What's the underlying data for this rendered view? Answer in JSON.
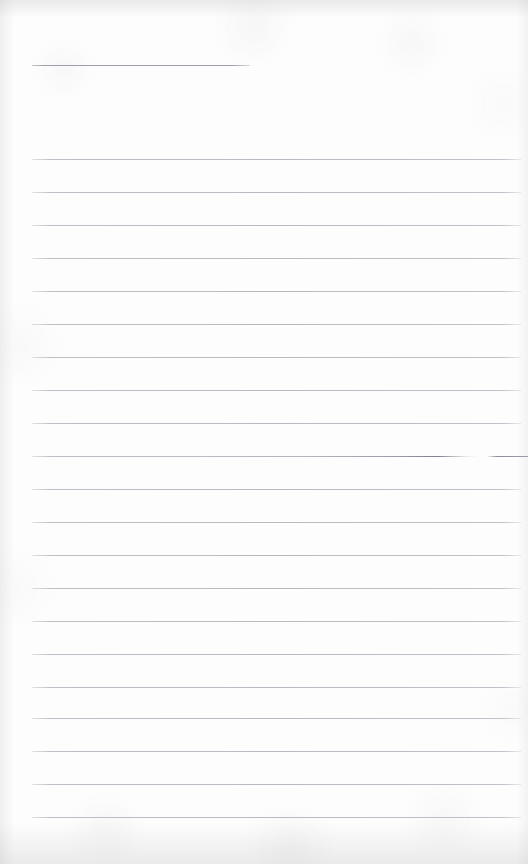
{
  "document": {
    "kind": "scanned-ruled-paper",
    "title": "Blank lined notebook page",
    "width": 528,
    "height": 864,
    "background_color": "#fdfdfd",
    "page_content_text": "",
    "handwriting_present": "none",
    "printed_text_present": "none"
  },
  "colors": {
    "paper": "#fdfdfd",
    "rule_light": "#bcbfc5",
    "rule_medium": "#b6b9c0",
    "rule_dark": "#9ca0a8",
    "rule_emphasis": "#7e828b",
    "edge_shadow": "#8c8c94"
  },
  "layout": {
    "rule_left_x": 32,
    "rule_right_x": 521,
    "rule_spacing": 33,
    "first_body_rule_y": 159,
    "last_body_rule_y": 816,
    "body_rule_count": 21
  },
  "header_rule": {
    "label": "short-top-rule",
    "x": 32,
    "y": 65,
    "width": 218
  },
  "body_rules": [
    {
      "y": 159,
      "x": 32,
      "width": 489,
      "emphasis": "normal"
    },
    {
      "y": 192,
      "x": 32,
      "width": 489,
      "emphasis": "normal"
    },
    {
      "y": 225,
      "x": 32,
      "width": 489,
      "emphasis": "normal"
    },
    {
      "y": 258,
      "x": 32,
      "width": 489,
      "emphasis": "normal"
    },
    {
      "y": 291,
      "x": 32,
      "width": 489,
      "emphasis": "normal"
    },
    {
      "y": 324,
      "x": 32,
      "width": 489,
      "emphasis": "normal"
    },
    {
      "y": 357,
      "x": 32,
      "width": 489,
      "emphasis": "normal"
    },
    {
      "y": 390,
      "x": 32,
      "width": 489,
      "emphasis": "normal"
    },
    {
      "y": 423,
      "x": 32,
      "width": 489,
      "emphasis": "normal"
    },
    {
      "y": 456,
      "x": 32,
      "width": 489,
      "emphasis": "strong"
    },
    {
      "y": 489,
      "x": 32,
      "width": 489,
      "emphasis": "normal"
    },
    {
      "y": 522,
      "x": 32,
      "width": 489,
      "emphasis": "normal"
    },
    {
      "y": 555,
      "x": 32,
      "width": 489,
      "emphasis": "normal"
    },
    {
      "y": 588,
      "x": 32,
      "width": 489,
      "emphasis": "normal"
    },
    {
      "y": 621,
      "x": 32,
      "width": 489,
      "emphasis": "normal"
    },
    {
      "y": 654,
      "x": 32,
      "width": 489,
      "emphasis": "normal"
    },
    {
      "y": 687,
      "x": 32,
      "width": 489,
      "emphasis": "normal"
    },
    {
      "y": 718,
      "x": 32,
      "width": 489,
      "emphasis": "normal"
    },
    {
      "y": 751,
      "x": 32,
      "width": 489,
      "emphasis": "normal"
    },
    {
      "y": 784,
      "x": 32,
      "width": 489,
      "emphasis": "normal"
    },
    {
      "y": 817,
      "x": 32,
      "width": 489,
      "emphasis": "normal"
    }
  ],
  "rule_tail": {
    "label": "emphasized-rule-right-tail",
    "x": 497,
    "y": 456,
    "width": 31
  }
}
